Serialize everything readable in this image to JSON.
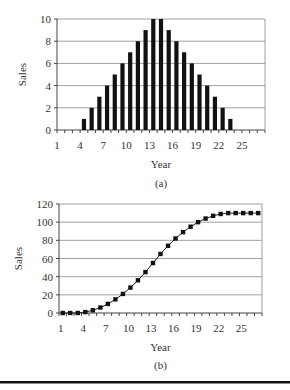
{
  "chart_data": [
    {
      "id": "a",
      "type": "bar",
      "caption": "(a)",
      "xlabel": "Year",
      "ylabel": "Sales",
      "ylim": [
        0,
        10
      ],
      "yticks": [
        0,
        2,
        4,
        6,
        8,
        10
      ],
      "xtick_labels": [
        "1",
        "4",
        "7",
        "10",
        "13",
        "16",
        "19",
        "22",
        "25"
      ],
      "grid": true,
      "categories": [
        1,
        2,
        3,
        4,
        5,
        6,
        7,
        8,
        9,
        10,
        11,
        12,
        13,
        14,
        15,
        16,
        17,
        18,
        19,
        20,
        21,
        22,
        23,
        24,
        25,
        26,
        27
      ],
      "values": [
        0,
        0,
        0,
        1,
        2,
        3,
        4,
        5,
        6,
        7,
        8,
        9,
        10,
        10,
        9,
        8,
        7,
        6,
        5,
        4,
        3,
        2,
        1,
        0,
        0,
        0,
        0
      ],
      "bar_color": "#111111"
    },
    {
      "id": "b",
      "type": "line",
      "caption": "(b)",
      "xlabel": "Year",
      "ylabel": "Sales",
      "ylim": [
        0,
        120
      ],
      "yticks": [
        0,
        20,
        40,
        60,
        80,
        100,
        120
      ],
      "xtick_labels": [
        "1",
        "4",
        "7",
        "10",
        "13",
        "16",
        "19",
        "22",
        "25"
      ],
      "grid": true,
      "x": [
        1,
        2,
        3,
        4,
        5,
        6,
        7,
        8,
        9,
        10,
        11,
        12,
        13,
        14,
        15,
        16,
        17,
        18,
        19,
        20,
        21,
        22,
        23,
        24,
        25,
        26,
        27
      ],
      "values": [
        0,
        0,
        0,
        1,
        3,
        6,
        10,
        15,
        21,
        28,
        36,
        45,
        55,
        65,
        74,
        82,
        89,
        95,
        100,
        104,
        107,
        109,
        110,
        110,
        110,
        110,
        110
      ],
      "marker": "square",
      "line_color": "#222222"
    }
  ]
}
